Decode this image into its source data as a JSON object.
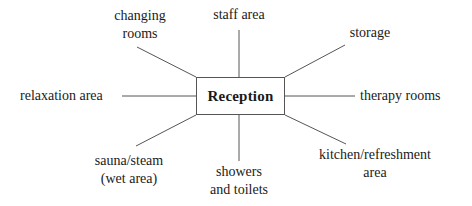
{
  "diagram": {
    "type": "spider-diagram",
    "center": {
      "label": "Reception"
    },
    "nodes": [
      {
        "id": "changing",
        "line1": "changing",
        "line2": "rooms",
        "position": "top-left"
      },
      {
        "id": "staff",
        "line1": "staff area",
        "line2": "",
        "position": "top"
      },
      {
        "id": "storage",
        "line1": "storage",
        "line2": "",
        "position": "top-right"
      },
      {
        "id": "relaxation",
        "line1": "relaxation area",
        "line2": "",
        "position": "left"
      },
      {
        "id": "therapy",
        "line1": "therapy rooms",
        "line2": "",
        "position": "right"
      },
      {
        "id": "sauna",
        "line1": "sauna/steam",
        "line2": "(wet area)",
        "position": "bottom-left"
      },
      {
        "id": "showers",
        "line1": "showers",
        "line2": "and toilets",
        "position": "bottom"
      },
      {
        "id": "kitchen",
        "line1": "kitchen/refreshment",
        "line2": "area",
        "position": "bottom-right"
      }
    ],
    "colors": {
      "line": "#555555",
      "text": "#1a1a1a",
      "background": "#ffffff"
    }
  }
}
